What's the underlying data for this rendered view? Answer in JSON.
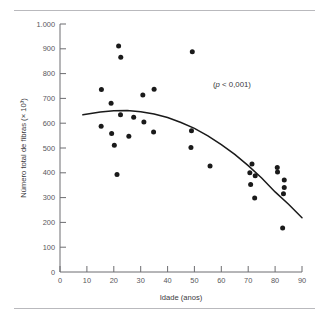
{
  "figure": {
    "name": "scatter-plot-fibras-idade",
    "annotation": "( p  < 0,001)",
    "annotation_prefix": "(",
    "annotation_italic": "p",
    "annotation_suffix": " < 0,001)"
  },
  "chart_data": {
    "type": "scatter",
    "title": "",
    "subtitle": "",
    "xlabel": "Idade (anos)",
    "ylabel": "Número total de fibras (× 10³)",
    "xlim": [
      0,
      90
    ],
    "ylim": [
      0,
      1000
    ],
    "xticks": [
      0,
      10,
      20,
      30,
      40,
      50,
      60,
      70,
      80,
      90
    ],
    "xticklabels": [
      "0",
      "10",
      "20",
      "30",
      "40",
      "50",
      "60",
      "70",
      "80",
      "90"
    ],
    "yticks": [
      0,
      100,
      200,
      300,
      400,
      500,
      600,
      700,
      800,
      900,
      1000
    ],
    "yticklabels": [
      "0",
      "100",
      "200",
      "300",
      "400",
      "500",
      "600",
      "700",
      "800",
      "900",
      "1.000"
    ],
    "grid": false,
    "legend": null,
    "annotations": [
      {
        "text": "(p < 0,001)",
        "x": 57,
        "y": 745
      }
    ],
    "series": [
      {
        "name": "fibras",
        "marker": "circle",
        "color": "#1a1a1a",
        "points": [
          {
            "x": 15.4,
            "y": 736
          },
          {
            "x": 15.3,
            "y": 588
          },
          {
            "x": 19.0,
            "y": 680
          },
          {
            "x": 19.2,
            "y": 558
          },
          {
            "x": 20.2,
            "y": 511
          },
          {
            "x": 21.2,
            "y": 393
          },
          {
            "x": 21.8,
            "y": 911
          },
          {
            "x": 22.6,
            "y": 866
          },
          {
            "x": 22.5,
            "y": 634
          },
          {
            "x": 25.6,
            "y": 547
          },
          {
            "x": 27.4,
            "y": 624
          },
          {
            "x": 30.8,
            "y": 714
          },
          {
            "x": 31.2,
            "y": 605
          },
          {
            "x": 35.0,
            "y": 737
          },
          {
            "x": 34.8,
            "y": 565
          },
          {
            "x": 49.2,
            "y": 888
          },
          {
            "x": 48.9,
            "y": 570
          },
          {
            "x": 48.7,
            "y": 502
          },
          {
            "x": 55.8,
            "y": 427
          },
          {
            "x": 70.6,
            "y": 400
          },
          {
            "x": 70.9,
            "y": 353
          },
          {
            "x": 71.4,
            "y": 435
          },
          {
            "x": 72.4,
            "y": 298
          },
          {
            "x": 72.6,
            "y": 388
          },
          {
            "x": 80.8,
            "y": 421
          },
          {
            "x": 80.9,
            "y": 403
          },
          {
            "x": 83.4,
            "y": 371
          },
          {
            "x": 83.4,
            "y": 341
          },
          {
            "x": 83.1,
            "y": 316
          },
          {
            "x": 82.8,
            "y": 177
          }
        ]
      }
    ],
    "fit_curve": {
      "name": "quadratic-trend",
      "color": "#1a1a1a",
      "x_start": 8.5,
      "x_end": 90,
      "points": [
        {
          "x": 8.5,
          "y": 634
        },
        {
          "x": 15,
          "y": 645
        },
        {
          "x": 20,
          "y": 650
        },
        {
          "x": 25,
          "y": 651
        },
        {
          "x": 30,
          "y": 646
        },
        {
          "x": 35,
          "y": 637
        },
        {
          "x": 40,
          "y": 623
        },
        {
          "x": 45,
          "y": 603
        },
        {
          "x": 50,
          "y": 579
        },
        {
          "x": 55,
          "y": 549
        },
        {
          "x": 60,
          "y": 514
        },
        {
          "x": 65,
          "y": 474
        },
        {
          "x": 70,
          "y": 429
        },
        {
          "x": 75,
          "y": 379
        },
        {
          "x": 80,
          "y": 323
        },
        {
          "x": 85,
          "y": 273
        },
        {
          "x": 90,
          "y": 219
        }
      ]
    }
  }
}
